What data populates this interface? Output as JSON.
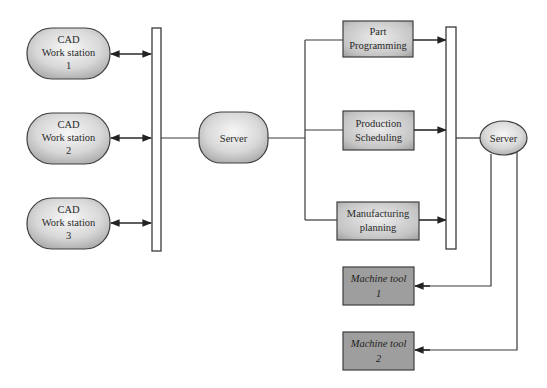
{
  "diagram": {
    "type": "network-architecture",
    "colors": {
      "background": "#ffffff",
      "pill_fill_light": "#f2f2f2",
      "pill_fill_dark": "#b4b4b4",
      "process_box_fill": "#c8c8c8",
      "machine_box_fill": "#9e9e9e",
      "line": "#3a3a3a"
    },
    "workstations": [
      {
        "line1": "CAD",
        "line2": "Work station",
        "line3": "1"
      },
      {
        "line1": "CAD",
        "line2": "Work station",
        "line3": "2"
      },
      {
        "line1": "CAD",
        "line2": "Work station",
        "line3": "3"
      }
    ],
    "server_main": {
      "label": "Server"
    },
    "processes": [
      {
        "line1": "Part",
        "line2": "Programming"
      },
      {
        "line1": "Production",
        "line2": "Scheduling"
      },
      {
        "line1": "Manufacturing",
        "line2": "planning"
      }
    ],
    "server_shop": {
      "label": "Server"
    },
    "machines": [
      {
        "line1": "Machine tool",
        "line2": "1"
      },
      {
        "line1": "Machine tool",
        "line2": "2"
      }
    ]
  }
}
